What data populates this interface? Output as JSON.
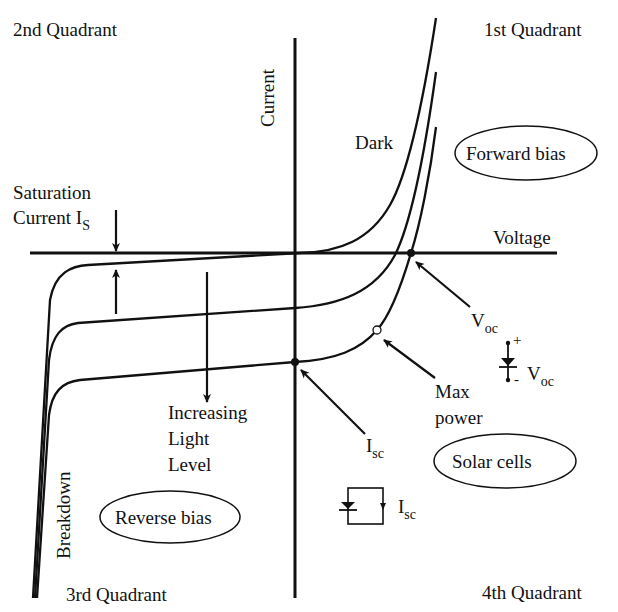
{
  "diagram": {
    "type": "solar-cell-iv-characteristics",
    "quadrants": {
      "q1": "1st Quadrant",
      "q2": "2nd Quadrant",
      "q3": "3rd Quadrant",
      "q4": "4th Quadrant"
    },
    "axes": {
      "x_label": "Voltage",
      "y_label": "Current"
    },
    "curves": [
      {
        "name": "Dark",
        "label": "Dark"
      },
      {
        "name": "Illuminated-1"
      },
      {
        "name": "Illuminated-2"
      }
    ],
    "annotations": {
      "saturation_line1": "Saturation",
      "saturation_line2": "Current I",
      "saturation_sub": "S",
      "increasing_line1": "Increasing",
      "increasing_line2": "Light",
      "increasing_line3": "Level",
      "breakdown": "Breakdown",
      "voc_main": "V",
      "voc_sub": "oc",
      "max_power_line1": "Max",
      "max_power_line2": "power",
      "isc_main": "I",
      "isc_sub": "sc",
      "voc_circuit_main": "V",
      "voc_circuit_sub": "oc",
      "voc_plus": "+",
      "voc_minus": "-",
      "isc_circuit_main": "I",
      "isc_circuit_sub": "sc"
    },
    "regions": {
      "forward": "Forward bias",
      "reverse": "Reverse bias",
      "solar": "Solar cells"
    }
  }
}
